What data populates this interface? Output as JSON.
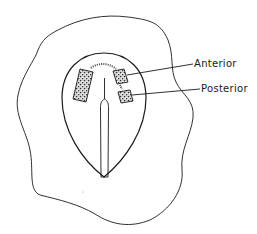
{
  "figure": {
    "type": "anatomical line drawing",
    "background": "#ffffff",
    "stroke_color": "#1a1a1a",
    "labels": [
      {
        "id": "anterior",
        "text": "Anterior"
      },
      {
        "id": "posterior",
        "text": "Posterior"
      }
    ]
  }
}
